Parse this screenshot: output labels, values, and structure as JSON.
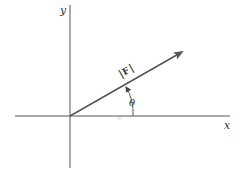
{
  "diagram": {
    "type": "vector-angle-diagram",
    "axes": {
      "x_label": "x",
      "y_label": "y",
      "origin": [
        70,
        116
      ]
    },
    "vector": {
      "label": "|F|",
      "label_bar_left": "|",
      "label_symbol": "F",
      "label_bar_right": "|",
      "start": [
        70,
        116
      ],
      "end": [
        182,
        52
      ]
    },
    "angle": {
      "label": "θ",
      "measured_from": "x-axis"
    },
    "colors": {
      "axis": "#555555",
      "vector": "#555555",
      "text": "#333333",
      "background": "#ffffff"
    }
  }
}
